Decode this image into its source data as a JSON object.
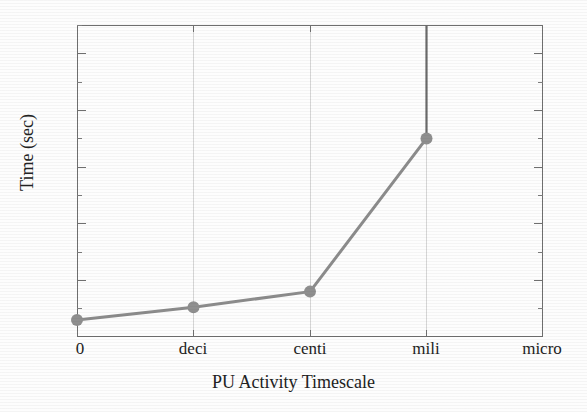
{
  "chart_data": {
    "type": "line",
    "title": "",
    "xlabel": "PU Activity Timescale",
    "ylabel": "Time (sec)",
    "categories": [
      "0",
      "deci",
      "centi",
      "mili",
      "micro"
    ],
    "x": [
      0,
      1,
      2,
      3,
      4
    ],
    "values": [
      4.6,
      5.05,
      5.6,
      11.0,
      null
    ],
    "series": [
      {
        "name": "Time",
        "values": [
          4.6,
          5.05,
          5.6,
          11.0,
          null
        ]
      }
    ],
    "ylim": [
      4,
      15
    ],
    "xlim": [
      0,
      4
    ],
    "y_ticks_major": [
      4,
      6,
      8,
      10,
      12,
      14
    ],
    "y_tick_labels": [
      "4",
      "6",
      "8",
      "10",
      "12",
      "14"
    ],
    "y_ticks_minor": [
      5,
      7,
      9,
      11,
      13,
      15
    ],
    "x_tick_labels": [
      "0",
      "deci",
      "centi",
      "mili",
      "micro"
    ],
    "grid": "vertical-only",
    "gridlines_x": [
      "deci",
      "centi",
      "mili"
    ],
    "legend": null,
    "legend_position": "none",
    "annotations": [
      {
        "name": "off-scale-riser",
        "at_category": "mili",
        "from_value": 11.0,
        "to_value": 15.0,
        "description": "vertical line rising from the mili data point to the top of the plot frame"
      }
    ],
    "marker": "filled-circle",
    "line_color": "#8c8c8c",
    "marker_color": "#8f8f8f",
    "riser_color": "#6a6a6a",
    "axis_color": "#6f6f6f",
    "grid_color": "#d6d6d6",
    "background_color": "#fdfdfd"
  }
}
